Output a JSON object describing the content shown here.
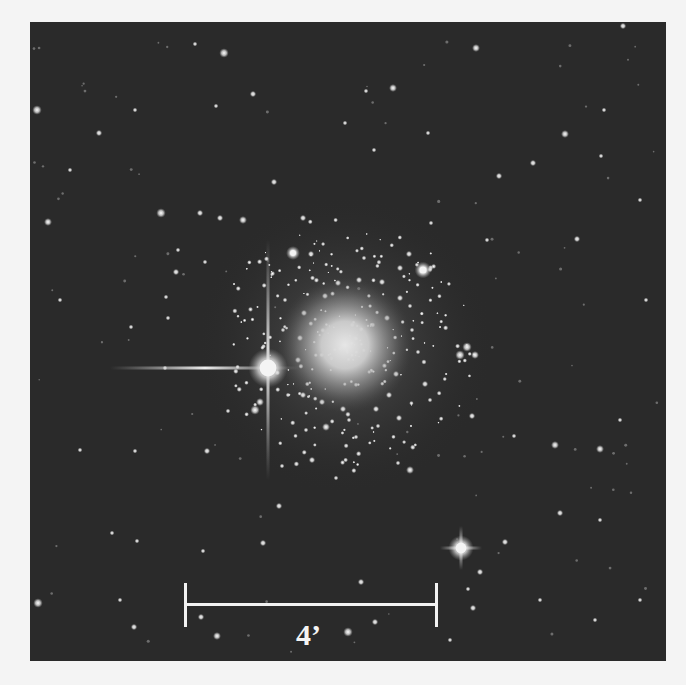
{
  "figure": {
    "background_color": "#2a2a2a",
    "page_color": "#f4f4f4",
    "frame": {
      "x": 30,
      "y": 22,
      "width": 636,
      "height": 639
    }
  },
  "scale_bar": {
    "label": "4’",
    "x1": 185,
    "x2": 436,
    "y": 604,
    "tick_top": 583,
    "tick_bottom": 627,
    "label_x": 296,
    "label_y": 620,
    "color": "#f2f2f2"
  },
  "cluster_core": {
    "cx": 345,
    "cy": 345,
    "r_core": 45,
    "r_halo": 150
  },
  "bright_stars": [
    {
      "x": 268,
      "y": 368,
      "size": 14,
      "spike_h": [
        110,
        300
      ],
      "spike_v": [
        240,
        480
      ]
    },
    {
      "x": 461,
      "y": 548,
      "size": 9,
      "spike_h": [
        440,
        482
      ],
      "spike_v": [
        526,
        570
      ]
    },
    {
      "x": 423,
      "y": 270,
      "size": 6
    },
    {
      "x": 293,
      "y": 253,
      "size": 5
    }
  ],
  "stars": [
    [
      224,
      53,
      3
    ],
    [
      195,
      44,
      1.5
    ],
    [
      253,
      94,
      2
    ],
    [
      135,
      110,
      1.5
    ],
    [
      37,
      110,
      3
    ],
    [
      99,
      133,
      2
    ],
    [
      216,
      106,
      1.5
    ],
    [
      48,
      222,
      2.5
    ],
    [
      161,
      213,
      3
    ],
    [
      200,
      213,
      2
    ],
    [
      220,
      218,
      2
    ],
    [
      243,
      220,
      2.5
    ],
    [
      178,
      250,
      1.5
    ],
    [
      176,
      272,
      2
    ],
    [
      205,
      262,
      1.5
    ],
    [
      131,
      327,
      1.5
    ],
    [
      166,
      297,
      1.5
    ],
    [
      168,
      318,
      1.5
    ],
    [
      311,
      254,
      2
    ],
    [
      303,
      218,
      2
    ],
    [
      274,
      182,
      2
    ],
    [
      476,
      48,
      2.5
    ],
    [
      393,
      88,
      2.5
    ],
    [
      428,
      133,
      1.5
    ],
    [
      565,
      134,
      2.5
    ],
    [
      533,
      163,
      2
    ],
    [
      499,
      176,
      2
    ],
    [
      431,
      223,
      1.5
    ],
    [
      601,
      156,
      1.5
    ],
    [
      604,
      110,
      1.5
    ],
    [
      623,
      26,
      2
    ],
    [
      577,
      239,
      2
    ],
    [
      487,
      240,
      1.5
    ],
    [
      374,
      150,
      1.5
    ],
    [
      366,
      91,
      1.5
    ],
    [
      345,
      123,
      1.5
    ],
    [
      409,
      254,
      2
    ],
    [
      400,
      268,
      2
    ],
    [
      425,
      384,
      2
    ],
    [
      410,
      470,
      2.5
    ],
    [
      398,
      463,
      1.5
    ],
    [
      356,
      437,
      1.5
    ],
    [
      430,
      400,
      1.5
    ],
    [
      472,
      416,
      2
    ],
    [
      467,
      347,
      3
    ],
    [
      460,
      355,
      3
    ],
    [
      475,
      355,
      2.5
    ],
    [
      555,
      445,
      2.5
    ],
    [
      600,
      449,
      2.5
    ],
    [
      514,
      436,
      1.5
    ],
    [
      560,
      513,
      2
    ],
    [
      505,
      542,
      2
    ],
    [
      480,
      572,
      2
    ],
    [
      468,
      589,
      1.5
    ],
    [
      473,
      608,
      2
    ],
    [
      165,
      368,
      1.5
    ],
    [
      207,
      451,
      2
    ],
    [
      228,
      411,
      1.5
    ],
    [
      255,
      410,
      3
    ],
    [
      260,
      402,
      2.5
    ],
    [
      279,
      506,
      2
    ],
    [
      263,
      543,
      2
    ],
    [
      203,
      551,
      1.5
    ],
    [
      201,
      617,
      2
    ],
    [
      135,
      451,
      1.5
    ],
    [
      112,
      533,
      1.5
    ],
    [
      137,
      541,
      1.5
    ],
    [
      38,
      603,
      3
    ],
    [
      134,
      627,
      2
    ],
    [
      217,
      636,
      2.5
    ],
    [
      348,
      632,
      3
    ],
    [
      375,
      622,
      2
    ],
    [
      361,
      582,
      2
    ],
    [
      312,
      460,
      2
    ],
    [
      336,
      478,
      1.5
    ],
    [
      282,
      466,
      1.5
    ],
    [
      326,
      427,
      2.5
    ],
    [
      343,
      409,
      2
    ],
    [
      306,
      430,
      1.5
    ],
    [
      399,
      418,
      2
    ],
    [
      378,
      426,
      1.5
    ],
    [
      387,
      318,
      2
    ],
    [
      400,
      298,
      2
    ],
    [
      382,
      282,
      2
    ],
    [
      359,
      280,
      2
    ],
    [
      338,
      283,
      2
    ],
    [
      325,
      296,
      2
    ],
    [
      304,
      313,
      2
    ],
    [
      300,
      338,
      2
    ],
    [
      298,
      360,
      2
    ],
    [
      396,
      374,
      2
    ],
    [
      389,
      395,
      2
    ],
    [
      376,
      409,
      2
    ],
    [
      322,
      402,
      2
    ],
    [
      303,
      395,
      2
    ],
    [
      412,
      330,
      1.5
    ],
    [
      418,
      352,
      1.5
    ],
    [
      283,
      330,
      1.5
    ],
    [
      285,
      300,
      1.5
    ],
    [
      410,
      306,
      1.5
    ],
    [
      288,
      395,
      1.5
    ],
    [
      349,
      420,
      1.5
    ],
    [
      364,
      258,
      1.5
    ],
    [
      595,
      620,
      1.5
    ],
    [
      640,
      600,
      1.5
    ],
    [
      620,
      420,
      1.5
    ],
    [
      646,
      300,
      1.5
    ],
    [
      640,
      200,
      1.5
    ],
    [
      600,
      520,
      1.5
    ],
    [
      540,
      600,
      1.5
    ],
    [
      450,
      640,
      1.5
    ],
    [
      120,
      600,
      1.5
    ],
    [
      80,
      450,
      1.5
    ],
    [
      60,
      300,
      1.5
    ],
    [
      70,
      170,
      1.5
    ]
  ]
}
